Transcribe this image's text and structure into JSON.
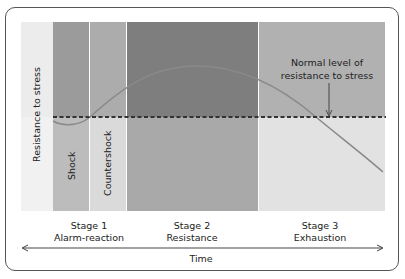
{
  "diagram": {
    "y_axis_label": "Resistance to stress",
    "x_axis_label": "Time",
    "annotation": {
      "line1": "Normal level of",
      "line2": "resistance to stress"
    },
    "sub_phases": [
      {
        "label": "Shock"
      },
      {
        "label": "Countershock"
      }
    ],
    "stages": [
      {
        "number": "Stage 1",
        "name": "Alarm-reaction"
      },
      {
        "number": "Stage 2",
        "name": "Resistance"
      },
      {
        "number": "Stage 3",
        "name": "Exhaustion"
      }
    ],
    "colors": {
      "label_band_top": "#ececec",
      "label_band_bottom": "#f0f0f0",
      "shock_top": "#9b9b9b",
      "shock_bottom": "#bdbdbd",
      "countershock_top": "#ababab",
      "countershock_bottom": "#d9d9d9",
      "resistance_top": "#7d7d7d",
      "resistance_bottom": "#a8a8a8",
      "exhaustion_top": "#b0b0b0",
      "exhaustion_bottom": "#e0e0e0",
      "curve": "#8a8a8a",
      "dashed_line": "#333333"
    }
  }
}
